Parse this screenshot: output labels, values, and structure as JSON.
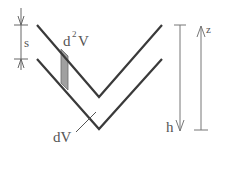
{
  "labels": {
    "s": "s",
    "d2V_base": "d",
    "d2V_sup": "2",
    "d2V_tail": "V",
    "dV": "dV",
    "h": "h",
    "z": "z"
  },
  "colors": {
    "line": "#3a3a3a",
    "dim_line": "#777777",
    "shade": "#9a9a9a",
    "text": "#555555"
  }
}
